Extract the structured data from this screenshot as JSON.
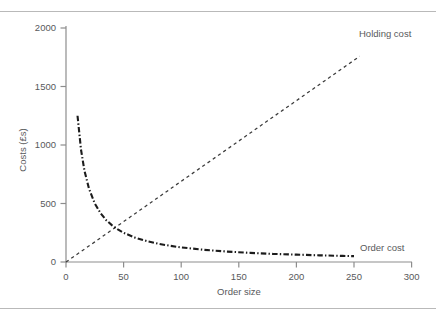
{
  "chart_data": {
    "type": "line",
    "title": "",
    "xlabel": "Order size",
    "ylabel": "Costs (£s)",
    "xlim": [
      0,
      300
    ],
    "ylim": [
      0,
      2000
    ],
    "xticks": [
      0,
      50,
      100,
      150,
      200,
      250,
      300
    ],
    "yticks": [
      0,
      500,
      1000,
      1500,
      2000
    ],
    "grid": false,
    "legend_position": "inline-annotations",
    "series": [
      {
        "name": "Holding cost",
        "label": "Holding cost",
        "style": "dashed",
        "color": "#3b3b3b",
        "x": [
          0,
          25,
          50,
          75,
          100,
          125,
          150,
          175,
          200,
          225,
          255
        ],
        "values": [
          0,
          172,
          345,
          517,
          690,
          862,
          1034,
          1207,
          1379,
          1552,
          1759
        ]
      },
      {
        "name": "Order cost",
        "label": "Order cost",
        "style": "dash-dot",
        "color": "#1c1c1c",
        "x": [
          10,
          13,
          16,
          20,
          25,
          30,
          35,
          40,
          45,
          50,
          60,
          70,
          80,
          90,
          100,
          120,
          140,
          160,
          180,
          200,
          220,
          240,
          250
        ],
        "values": [
          1250,
          962,
          781,
          625,
          500,
          417,
          357,
          313,
          278,
          250,
          208,
          179,
          156,
          139,
          125,
          104,
          89,
          78,
          69,
          63,
          57,
          52,
          50
        ]
      }
    ],
    "annotations": [
      {
        "text": "Holding cost",
        "x": 300,
        "y": 1930
      },
      {
        "text": "Order cost",
        "x": 278,
        "y": 195
      }
    ],
    "axis_color": "#8d8d8d",
    "background": "#ffffff"
  }
}
